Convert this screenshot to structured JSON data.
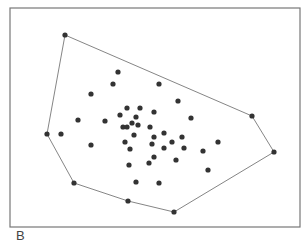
{
  "figure": {
    "panel_label": "B",
    "frame": {
      "x": 10,
      "y": 8,
      "width": 290,
      "height": 219,
      "stroke": "#777777"
    },
    "colors": {
      "point": "#333333",
      "hull": "#777777"
    },
    "point_radius": 2.6
  },
  "chart_data": {
    "type": "scatter",
    "title": "",
    "subtitle": "Convex hull of a 2D point set",
    "xlabel": "",
    "ylabel": "",
    "grid": false,
    "legend": null,
    "annotations": [
      "B"
    ],
    "coordinate_system": "pixel (image coordinates, y down)",
    "hull_vertices": [
      [
        65,
        35
      ],
      [
        252,
        116
      ],
      [
        274,
        152
      ],
      [
        174,
        212
      ],
      [
        128,
        201
      ],
      [
        74,
        183
      ],
      [
        47,
        134
      ]
    ],
    "interior_points": [
      [
        118,
        72
      ],
      [
        113,
        84
      ],
      [
        159,
        84
      ],
      [
        91,
        94
      ],
      [
        178,
        101
      ],
      [
        127,
        108
      ],
      [
        140,
        108
      ],
      [
        154,
        112
      ],
      [
        120,
        115
      ],
      [
        136,
        117
      ],
      [
        191,
        118
      ],
      [
        78,
        120
      ],
      [
        105,
        121
      ],
      [
        132,
        123
      ],
      [
        138,
        125
      ],
      [
        123,
        127
      ],
      [
        127,
        127
      ],
      [
        150,
        127
      ],
      [
        61,
        134
      ],
      [
        134,
        135
      ],
      [
        154,
        137
      ],
      [
        164,
        133
      ],
      [
        182,
        137
      ],
      [
        91,
        145
      ],
      [
        125,
        142
      ],
      [
        152,
        144
      ],
      [
        172,
        142
      ],
      [
        218,
        142
      ],
      [
        164,
        148
      ],
      [
        184,
        148
      ],
      [
        130,
        149
      ],
      [
        203,
        151
      ],
      [
        154,
        157
      ],
      [
        176,
        160
      ],
      [
        149,
        163
      ],
      [
        129,
        165
      ],
      [
        208,
        170
      ],
      [
        136,
        182
      ],
      [
        159,
        183
      ]
    ]
  }
}
